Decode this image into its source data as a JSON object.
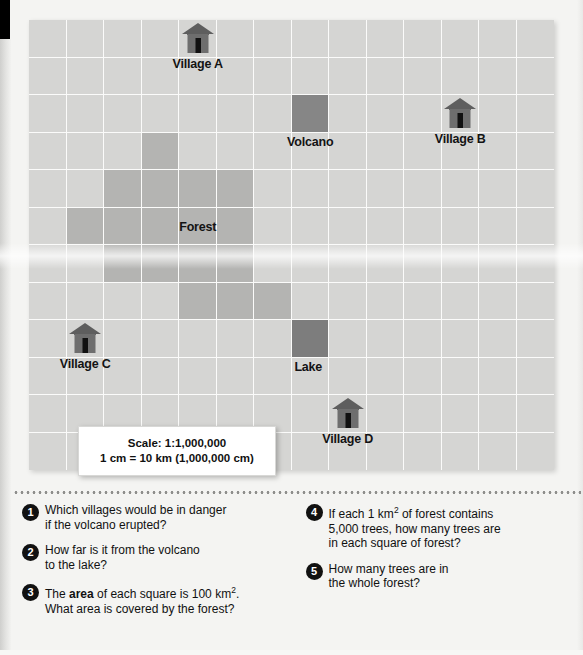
{
  "map": {
    "grid": {
      "cols": 14,
      "rows": 12
    },
    "terrain": {
      "forest_cells": [
        [
          3,
          3
        ],
        [
          2,
          4
        ],
        [
          3,
          4
        ],
        [
          4,
          4
        ],
        [
          5,
          4
        ],
        [
          1,
          5
        ],
        [
          2,
          5
        ],
        [
          3,
          5
        ],
        [
          4,
          5
        ],
        [
          5,
          5
        ],
        [
          2,
          6
        ],
        [
          3,
          6
        ],
        [
          4,
          6
        ],
        [
          5,
          6
        ],
        [
          4,
          7
        ],
        [
          5,
          7
        ],
        [
          6,
          7
        ]
      ],
      "volcano_cell": [
        7,
        2
      ],
      "lake_cell": [
        7,
        8
      ]
    },
    "colors": {
      "base": "#d5d5d3",
      "gridline": "#fbfbfa",
      "forest": "#b4b4b2",
      "volcano": "#868686",
      "lake": "#7d7d7d",
      "house_roof": "#5e5e5e",
      "house_body": "#6e6e6e",
      "house_door": "#111111",
      "label_text": "#131313"
    },
    "labels": {
      "village_a": "Village A",
      "village_b": "Village B",
      "village_c": "Village C",
      "village_d": "Village D",
      "volcano": "Volcano",
      "lake": "Lake",
      "forest": "Forest"
    },
    "markers": [
      {
        "name": "village-a",
        "icon": "house-icon",
        "label": "Village A",
        "col": 4,
        "row": 0
      },
      {
        "name": "village-b",
        "icon": "house-icon",
        "label": "Village B",
        "col": 11,
        "row": 2
      },
      {
        "name": "village-c",
        "icon": "house-icon",
        "label": "Village C",
        "col": 1,
        "row": 8
      },
      {
        "name": "village-d",
        "icon": "house-icon",
        "label": "Village D",
        "col": 8,
        "row": 10
      }
    ],
    "scale": {
      "line1": "Scale: 1:1,000,000",
      "line2": "1 cm = 10 km (1,000,000 cm)"
    }
  },
  "questions": {
    "left": [
      {
        "num": "1",
        "html": "Which villages would be in danger<br>if the volcano erupted?"
      },
      {
        "num": "2",
        "html": "How far is it from the volcano<br>to the lake?"
      },
      {
        "num": "3",
        "html": "The <b>area</b> of each square is 100 km<sup>2</sup>.<br>What area is covered by the forest?"
      }
    ],
    "right": [
      {
        "num": "4",
        "html": "If each 1 km<sup>2</sup> of forest contains<br>5,000 trees, how many trees are<br>in each square of forest?"
      },
      {
        "num": "5",
        "html": "How many trees are in<br>the whole forest?"
      }
    ]
  }
}
